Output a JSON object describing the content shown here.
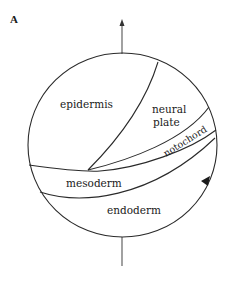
{
  "panel_label": "A",
  "regions": {
    "epidermis": "epidermis",
    "neural_plate_line1": "neural",
    "neural_plate_line2": "plate",
    "notochord": "notochord",
    "mesoderm": "mesoderm",
    "endoderm": "endoderm"
  },
  "colors": {
    "line": "#2a2a2a",
    "axis": "#555555",
    "background": "#ffffff"
  }
}
